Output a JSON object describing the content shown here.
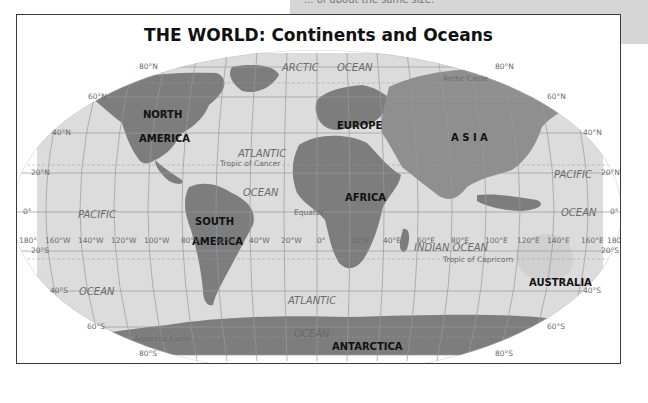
{
  "page": {
    "top_note": "... of about the same size.",
    "title": "THE WORLD: Continents and Oceans"
  },
  "colors": {
    "land": "#7d7d7d",
    "land_asia": "#8f8f8f",
    "ocean": "#dcdcdc",
    "grid": "#9a9a9a",
    "frame": "#3a3a3a"
  },
  "continents": {
    "north_america": [
      "NORTH",
      "AMERICA"
    ],
    "south_america": [
      "SOUTH",
      "AMERICA"
    ],
    "europe": "EUROPE",
    "asia": "A S I A",
    "africa": "AFRICA",
    "australia": "AUSTRALIA",
    "antarctica": "ANTARCTICA"
  },
  "oceans": {
    "arctic": [
      "ARCTIC",
      "OCEAN"
    ],
    "atlantic_north": [
      "ATLANTIC",
      "OCEAN"
    ],
    "atlantic_south": [
      "ATLANTIC",
      "OCEAN"
    ],
    "pacific_west": [
      "PACIFIC",
      "OCEAN"
    ],
    "pacific_east": [
      "PACIFIC",
      "OCEAN"
    ],
    "indian": "INDIAN OCEAN"
  },
  "special_lines": {
    "arctic_circle": "Arctic Circle",
    "tropic_cancer": "Tropic of Cancer",
    "equator": "Equator",
    "tropic_capricorn": "Tropic of Capricorn",
    "antarctic_circle": "Antarctic Circle"
  },
  "latitude_labels": {
    "n80": "80°N",
    "n60": "60°N",
    "n40": "40°N",
    "n20": "20°N",
    "zero": "0°",
    "s20": "20°S",
    "s40": "40°S",
    "s60": "60°S",
    "s80": "80°S"
  },
  "longitude_labels": [
    "180°",
    "160°W",
    "140°W",
    "120°W",
    "100°W",
    "80°W",
    "60°W",
    "40°W",
    "20°W",
    "0°",
    "20°E",
    "40°E",
    "60°E",
    "80°E",
    "100°E",
    "120°E",
    "140°E",
    "160°E",
    "180°"
  ]
}
